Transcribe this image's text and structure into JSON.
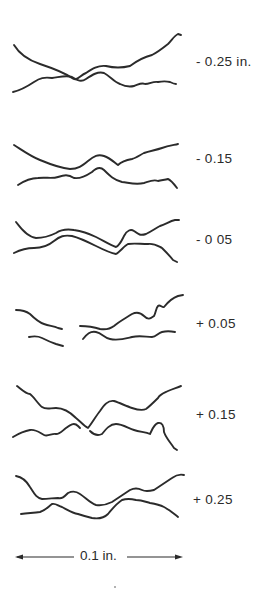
{
  "figure": {
    "profiles": [
      {
        "label": "- 0.25 in."
      },
      {
        "label": "- 0.15"
      },
      {
        "label": "- 0 05"
      },
      {
        "label": "+ 0.05"
      },
      {
        "label": "+ 0.15"
      },
      {
        "label": "+ 0.25"
      }
    ],
    "scale_bar": {
      "label": "0.1 in."
    }
  }
}
